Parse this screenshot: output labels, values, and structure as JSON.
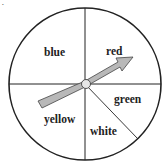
{
  "diagram": {
    "type": "spinner",
    "sections": [
      {
        "name": "blue",
        "label": "blue"
      },
      {
        "name": "red",
        "label": "red"
      },
      {
        "name": "green",
        "label": "green"
      },
      {
        "name": "white",
        "label": "white"
      },
      {
        "name": "yellow",
        "label": "yellow"
      }
    ],
    "marker": "•",
    "colors": {
      "outline": "#222222",
      "arrow_fill": "#b8b8b8",
      "hub_fill": "#e6e6e6"
    }
  }
}
